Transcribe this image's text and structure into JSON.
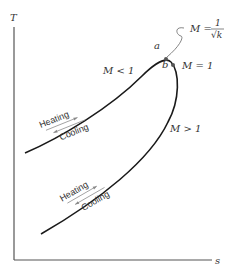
{
  "diagram": {
    "axes": {
      "y_label": "T",
      "x_label": "s"
    },
    "upper_curve": {
      "region_label": "M < 1",
      "heating_label": "Heating",
      "cooling_label": "Cooling"
    },
    "lower_curve": {
      "region_label": "M > 1",
      "heating_label": "Heating",
      "cooling_label": "Cooling"
    },
    "points": {
      "a": {
        "label": "a",
        "annotation_lhs": "M =",
        "annotation_num": "1",
        "annotation_den": "√k"
      },
      "b": {
        "label": "b",
        "annotation": "M = 1"
      }
    },
    "colors": {
      "curve": "#1a1a1a",
      "axis": "#555555",
      "arrow": "#888888",
      "text": "#333333"
    }
  }
}
